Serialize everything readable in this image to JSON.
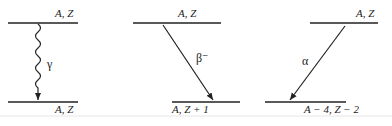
{
  "diagram": {
    "panels": [
      {
        "name": "gamma-decay",
        "transition_symbol": "γ",
        "transition_style": "wavy",
        "initial_label": "A, Z",
        "final_label": "A, Z"
      },
      {
        "name": "beta-minus-decay",
        "transition_symbol": "β⁻",
        "transition_style": "straight-arrow",
        "initial_label": "A, Z",
        "final_label": "A, Z + 1"
      },
      {
        "name": "alpha-decay",
        "transition_symbol": "α",
        "transition_style": "straight-arrow",
        "initial_label": "A, Z",
        "final_label": "A − 4, Z − 2"
      }
    ],
    "colors": {
      "ink": "#222222",
      "background": "#ffffff",
      "rule": "#e6e6e6"
    }
  }
}
